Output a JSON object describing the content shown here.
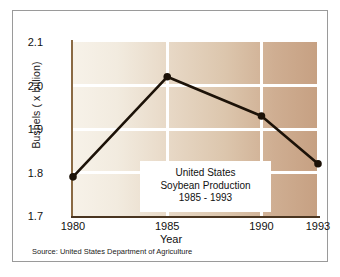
{
  "chart_data": {
    "type": "line",
    "title": "United States Soybean Production 1985 - 1993",
    "annotation_lines": [
      "United States",
      "Soybean Production",
      "1985 - 1993"
    ],
    "xlabel": "Year",
    "ylabel": "Bushels ( x billion)",
    "x": [
      1980,
      1985,
      1990,
      1993
    ],
    "values": [
      1.79,
      2.02,
      1.93,
      1.82
    ],
    "xtick_labels": [
      "1980",
      "1985",
      "1990",
      "1993"
    ],
    "ytick_labels": [
      "1.7",
      "1.8",
      "1.9",
      "2.0",
      "2.1"
    ],
    "ytick_values": [
      1.7,
      1.8,
      1.9,
      2.0,
      2.1
    ],
    "xlim": [
      1980,
      1993
    ],
    "ylim": [
      1.7,
      2.1
    ],
    "grid": true,
    "gridline_color": "#ffffff",
    "legend": "none",
    "series_color": "#1c1208",
    "marker": "circle",
    "source": "Source: United States Department of Agriculture",
    "background_gradient_start": "#f7f2e9",
    "background_gradient_end": "#c6a082"
  }
}
